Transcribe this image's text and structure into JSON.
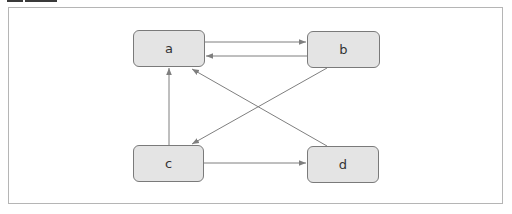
{
  "diagram": {
    "type": "directed-graph",
    "colors": {
      "node_fill": "#e4e4e4",
      "node_border": "#7a7a7a",
      "edge": "#7f7f7f",
      "frame": "#b5b5b5"
    },
    "nodes": [
      {
        "id": "a",
        "label": "a",
        "x": 133,
        "y": 30,
        "w": 72,
        "h": 37
      },
      {
        "id": "b",
        "label": "b",
        "x": 307,
        "y": 31,
        "w": 73,
        "h": 37
      },
      {
        "id": "c",
        "label": "c",
        "x": 133,
        "y": 145,
        "w": 71,
        "h": 37
      },
      {
        "id": "d",
        "label": "d",
        "x": 307,
        "y": 146,
        "w": 72,
        "h": 37
      }
    ],
    "edges": [
      {
        "from": "a",
        "to": "b",
        "x1": 205,
        "y1": 42,
        "x2": 306,
        "y2": 42
      },
      {
        "from": "b",
        "to": "a",
        "x1": 307,
        "y1": 56,
        "x2": 206,
        "y2": 56
      },
      {
        "from": "c",
        "to": "a",
        "x1": 169,
        "y1": 145,
        "x2": 169,
        "y2": 68
      },
      {
        "from": "b",
        "to": "c",
        "x1": 327,
        "y1": 68,
        "x2": 192,
        "y2": 144
      },
      {
        "from": "d",
        "to": "a",
        "x1": 327,
        "y1": 146,
        "x2": 192,
        "y2": 69
      },
      {
        "from": "c",
        "to": "d",
        "x1": 204,
        "y1": 163,
        "x2": 306,
        "y2": 163
      }
    ]
  }
}
